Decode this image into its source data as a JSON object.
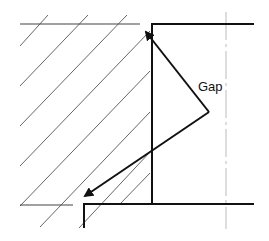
{
  "diagram": {
    "title": "",
    "labels": {
      "gap": "Gap"
    },
    "colors": {
      "thick_line": "#111111",
      "thin_line": "#444444",
      "hatch": "#555555",
      "dashed_centerline": "#bbbbbb",
      "background": "#ffffff"
    },
    "elements": [
      "hatched-region",
      "top-thin-edge",
      "top-thick-edge",
      "vertical-thick-wall",
      "bottom-thin-edge",
      "bottom-thick-edge",
      "step-vertical",
      "dashed-centerline",
      "arrow-up-left",
      "arrow-down-left",
      "gap-label"
    ]
  }
}
